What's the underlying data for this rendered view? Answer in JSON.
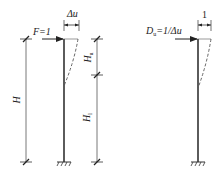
{
  "figure": {
    "left_diagram": {
      "force_label": "F=1",
      "displacement_label": "Δu",
      "total_height_label": "H",
      "upper_height_label": "H",
      "upper_height_sub": "u",
      "lower_height_label": "H",
      "lower_height_sub": "l"
    },
    "right_diagram": {
      "unit_displacement_label": "1",
      "stiffness_label_main": "D",
      "stiffness_label_sub": "u",
      "stiffness_label_rest": "=1/Δu"
    },
    "colors": {
      "line": "#333333",
      "dashed": "#555555",
      "background": "#ffffff"
    }
  }
}
